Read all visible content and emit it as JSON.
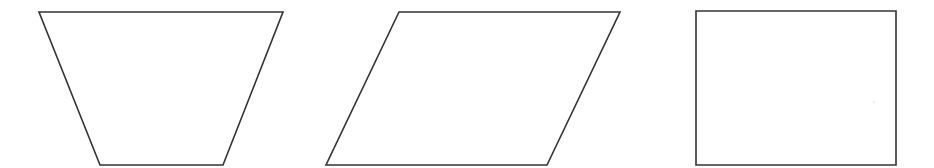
{
  "canvas": {
    "width": 934,
    "height": 168,
    "background": "#ffffff"
  },
  "style": {
    "stroke_color": "#333333",
    "fill_color": "#ffffff",
    "stroke_width": 1.6
  },
  "shapes": [
    {
      "kind": "trapezoid",
      "label": "",
      "points": "39,12 283,12 223,165 100,165"
    },
    {
      "kind": "parallelogram",
      "label": "",
      "points": "399,12 620,12 547,165 326,165"
    },
    {
      "kind": "rectangle",
      "label": "",
      "points": "696,11 896,11 896,165 696,165"
    }
  ]
}
